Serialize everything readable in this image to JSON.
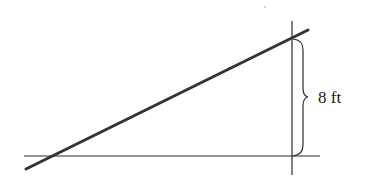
{
  "diagram": {
    "type": "geometry-figure",
    "labels": {
      "vertical_height": "8 ft"
    },
    "elements": {
      "ground_line": {
        "x1": 24,
        "y1": 156,
        "x2": 320,
        "y2": 156
      },
      "vertical_line": {
        "x1": 292,
        "y1": 21,
        "x2": 292,
        "y2": 175
      },
      "sloped_line": {
        "x1": 26,
        "y1": 169,
        "x2": 308,
        "y2": 30
      },
      "brace": {
        "x": 296,
        "y_top": 38,
        "y_bottom": 156,
        "y_mid": 97
      }
    },
    "colors": {
      "stroke": "#2a2a2a",
      "thick_stroke": "#333333",
      "background": "#ffffff"
    }
  }
}
